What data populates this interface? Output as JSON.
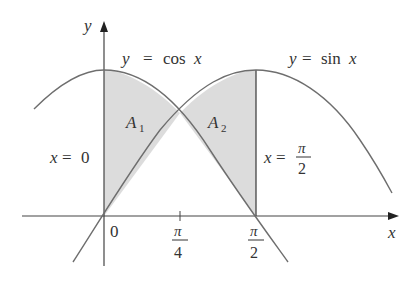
{
  "figure": {
    "axes": {
      "x_label": "x",
      "y_label": "y",
      "origin_label": "0",
      "ticks": [
        {
          "num": "π",
          "den": "4"
        },
        {
          "num": "π",
          "den": "2"
        }
      ]
    },
    "curves": {
      "cos": {
        "label_lhs": "y",
        "label_eq": "=",
        "label_fn": "cos",
        "label_var": "x"
      },
      "sin": {
        "label_lhs": "y",
        "label_eq": "=",
        "label_fn": "sin",
        "label_var": "x"
      }
    },
    "regions": {
      "a1": {
        "letter": "A",
        "sub": "1"
      },
      "a2": {
        "letter": "A",
        "sub": "2"
      }
    },
    "boundaries": {
      "left": {
        "var": "x",
        "eq": "=",
        "val": "0"
      },
      "right": {
        "var": "x",
        "eq": "=",
        "num": "π",
        "den": "2"
      }
    },
    "colors": {
      "shade": "#dcdcdc",
      "curve": "#6e6e6e",
      "axis": "#444444",
      "text": "#333333"
    }
  }
}
